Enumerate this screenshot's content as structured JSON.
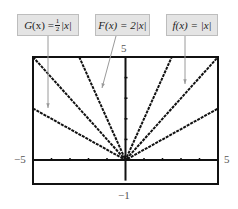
{
  "chart_data": {
    "type": "line",
    "title": "",
    "xlabel": "",
    "ylabel": "",
    "xlim": [
      -5,
      5
    ],
    "ylim": [
      -1,
      5
    ],
    "grid": false,
    "x_tick_step": 1,
    "y_tick_step": 1,
    "tick_labels": {
      "x_min": "−5",
      "x_max": "5",
      "y_min": "−1",
      "y_max": "5"
    },
    "series": [
      {
        "name": "G(x) = ½|x|",
        "formula": "0.5*abs(x)",
        "x": [
          -5,
          0,
          5
        ],
        "values": [
          2.5,
          0,
          2.5
        ]
      },
      {
        "name": "F(x) = 2|x|",
        "formula": "2*abs(x)",
        "x": [
          -2.5,
          0,
          2.5
        ],
        "values": [
          5,
          0,
          5
        ]
      },
      {
        "name": "f(x) = |x|",
        "formula": "abs(x)",
        "x": [
          -5,
          0,
          5
        ],
        "values": [
          5,
          0,
          5
        ]
      }
    ],
    "annotations": [
      {
        "label": "G(x) = ½|x|",
        "points_to": "G left branch"
      },
      {
        "label": "F(x) = 2|x|",
        "points_to": "F left branch"
      },
      {
        "label": "f(x) = |x|",
        "points_to": "f right branch"
      }
    ],
    "colors": {
      "curve": "#111111",
      "axis": "#111111",
      "tag_bg": "#e4e4e4",
      "tag_border": "#bdbdbd",
      "arrow": "#9a9a9a",
      "tick_label": "#555555"
    }
  },
  "labels": {
    "G": {
      "func": "G",
      "var": "(x) = ",
      "num": "1",
      "den": "2",
      "abs": "|x|"
    },
    "F": {
      "text": "F(x) = 2|x|"
    },
    "f": {
      "text": "f(x) = |x|"
    },
    "y_max": "5",
    "y_min": "−1",
    "x_min": "−5",
    "x_max": "5"
  }
}
